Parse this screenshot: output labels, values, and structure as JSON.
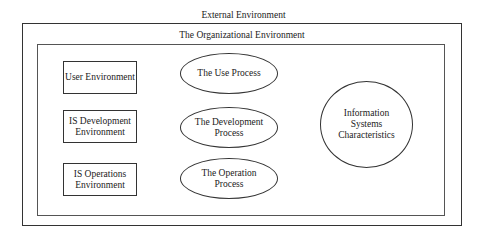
{
  "diagram": {
    "external_label": "External Environment",
    "organizational_label": "The Organizational Environment",
    "environments": [
      {
        "label": "User Environment"
      },
      {
        "label": "IS Development Environment",
        "lines": [
          "IS Development",
          "Environment"
        ]
      },
      {
        "label": "IS Operations Environment",
        "lines": [
          "IS Operations",
          "Environment"
        ]
      }
    ],
    "processes": [
      {
        "label": "The Use Process"
      },
      {
        "label": "The Development Process",
        "lines": [
          "The Development",
          "Process"
        ]
      },
      {
        "label": "The Operation Process",
        "lines": [
          "The Operation",
          "Process"
        ]
      }
    ],
    "characteristics": {
      "label": "Information Systems Characteristics",
      "lines": [
        "Information",
        "Systems",
        "Characteristics"
      ]
    }
  }
}
